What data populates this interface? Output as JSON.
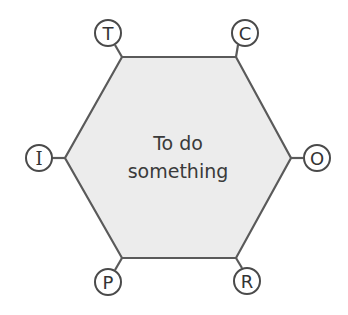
{
  "diagram": {
    "type": "hexagon-function",
    "center_label_line1": "To do",
    "center_label_line2": "something",
    "colors": {
      "hex_fill": "#ececec",
      "stroke": "#5a5a5a",
      "text": "#333333"
    },
    "aspects": {
      "T": "T",
      "C": "C",
      "I": "I",
      "O": "O",
      "P": "P",
      "R": "R"
    }
  }
}
